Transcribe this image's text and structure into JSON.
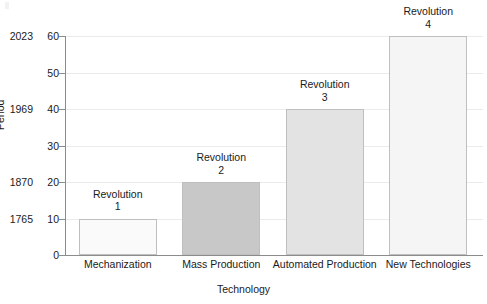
{
  "chart_data": {
    "type": "bar",
    "title": "",
    "subtitle": "",
    "xlabel": "Technology",
    "ylabel": "Period",
    "categories": [
      "Mechanization",
      "Mass Production",
      "Automated Production",
      "New Technologies"
    ],
    "values": [
      10,
      20,
      40,
      60
    ],
    "bar_labels": [
      "Revolution\n1",
      "Revolution\n2",
      "Revolution\n3",
      "Revolution\n4"
    ],
    "bar_label_lines": [
      [
        "Revolution",
        "1"
      ],
      [
        "Revolution",
        "2"
      ],
      [
        "Revolution",
        "3"
      ],
      [
        "Revolution",
        "4"
      ]
    ],
    "bar_colors": [
      "#fafafa",
      "#c8c8c8",
      "#e3e3e3",
      "#f5f5f5"
    ],
    "bar_edge_color": "#bfbfbf",
    "ylim": [
      0,
      60
    ],
    "yticks": [
      0,
      10,
      20,
      30,
      40,
      50,
      60
    ],
    "ytick_labels": [
      "0",
      "10",
      "20",
      "30",
      "40",
      "50",
      "60"
    ],
    "secondary_ytick_labels": [
      "",
      "1765",
      "1870",
      "",
      "1969",
      "",
      "2023"
    ],
    "secondary_ytick_values": [
      10,
      20,
      40,
      60
    ],
    "secondary_ytick_years": [
      "1765",
      "1870",
      "1969",
      "2023"
    ],
    "grid": true,
    "grid_color": "#ebebeb",
    "legend": false,
    "legend_position": "none",
    "axis_color": "#8c8c8c",
    "background": "#ffffff"
  },
  "axes": {
    "y_title": "Period",
    "x_title": "Technology"
  },
  "ticks": {
    "y": [
      {
        "value": 60,
        "num": "60",
        "year": "2023"
      },
      {
        "value": 50,
        "num": "50",
        "year": ""
      },
      {
        "value": 40,
        "num": "40",
        "year": "1969"
      },
      {
        "value": 30,
        "num": "30",
        "year": ""
      },
      {
        "value": 20,
        "num": "20",
        "year": "1870"
      },
      {
        "value": 10,
        "num": "10",
        "year": "1765"
      },
      {
        "value": 0,
        "num": "0",
        "year": ""
      }
    ]
  },
  "bars": [
    {
      "category": "Mechanization",
      "value": 10,
      "label_line1": "Revolution",
      "label_line2": "1",
      "color": "#fafafa"
    },
    {
      "category": "Mass Production",
      "value": 20,
      "label_line1": "Revolution",
      "label_line2": "2",
      "color": "#c8c8c8"
    },
    {
      "category": "Automated Production",
      "value": 40,
      "label_line1": "Revolution",
      "label_line2": "3",
      "color": "#e3e3e3"
    },
    {
      "category": "New Technologies",
      "value": 60,
      "label_line1": "Revolution",
      "label_line2": "4",
      "color": "#f5f5f5"
    }
  ]
}
